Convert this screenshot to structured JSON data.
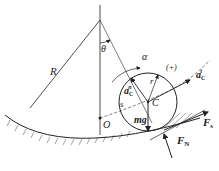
{
  "diagram": {
    "labels": {
      "R": "R",
      "theta": "θ",
      "alpha": "α",
      "plus": "(+)",
      "r": "r",
      "C": "C",
      "O": "O",
      "s": "s",
      "mg": "mg",
      "aCn_base": "a",
      "aCn_sub": "C",
      "aCn_sup": "n",
      "aCt_base": "a",
      "aCt_sub": "C",
      "aCt_sup": "t",
      "FN_base": "F",
      "FN_sub": "N",
      "Fs_base": "F",
      "Fs_sub": "s"
    },
    "colors": {
      "line": "#222222",
      "background": "#ffffff"
    }
  }
}
